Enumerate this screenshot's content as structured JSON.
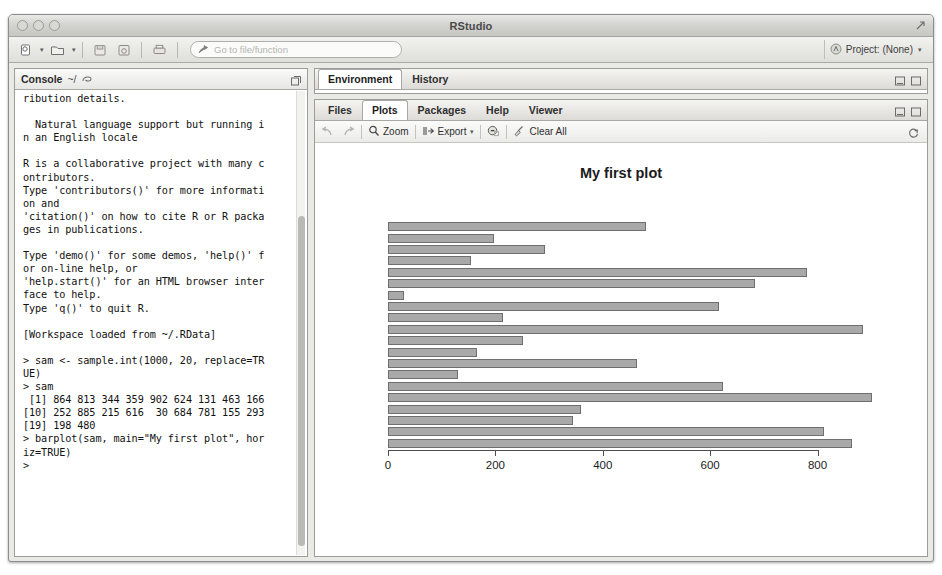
{
  "window": {
    "title": "RStudio",
    "traffic_lights": [
      "close-button",
      "minimize-button",
      "zoom-button"
    ],
    "expand_icon": "expand-icon"
  },
  "toolbar": {
    "new_file_label": "",
    "items": [
      {
        "name": "new-file-button",
        "icon": "new-file-icon",
        "caret": true
      },
      {
        "name": "new-project-button",
        "icon": "new-project-icon",
        "caret": true
      },
      {
        "name": "save-button",
        "icon": "save-icon",
        "caret": false
      },
      {
        "name": "save-all-button",
        "icon": "save-all-icon",
        "caret": false
      },
      {
        "name": "print-button",
        "icon": "print-icon",
        "caret": false
      }
    ],
    "goto": {
      "icon": "goto-arrow-icon",
      "placeholder": "Go to file/function",
      "value": ""
    },
    "project": {
      "icon": "project-icon",
      "label": "Project: (None)",
      "caret": "▾"
    }
  },
  "console": {
    "title": "Console",
    "path": "~/",
    "path_icon": "clear-console-icon",
    "maximize_icon": "maximize-icon",
    "text": "ribution details.\n\n  Natural language support but running i\nn an English locale\n\nR is a collaborative project with many c\nontributors.\nType 'contributors()' for more informati\non and\n'citation()' on how to cite R or R packa\nges in publications.\n\nType 'demo()' for some demos, 'help()' f\nor on-line help, or\n'help.start()' for an HTML browser inter\nface to help.\nType 'q()' to quit R.\n\n[Workspace loaded from ~/.RData]\n\n> sam <- sample.int(1000, 20, replace=TR\nUE)\n> sam\n [1] 864 813 344 359 902 624 131 463 166\n[10] 252 885 215 616  30 684 781 155 293\n[19] 198 480\n> barplot(sam, main=\"My first plot\", hor\niz=TRUE)\n> "
  },
  "environment_pane": {
    "tabs": [
      {
        "label": "Environment",
        "active": true
      },
      {
        "label": "History",
        "active": false
      }
    ],
    "icons": [
      "minimize-icon",
      "maximize-icon"
    ]
  },
  "plots_pane": {
    "tabs": [
      {
        "label": "Files",
        "active": false
      },
      {
        "label": "Plots",
        "active": true
      },
      {
        "label": "Packages",
        "active": false
      },
      {
        "label": "Help",
        "active": false
      },
      {
        "label": "Viewer",
        "active": false
      }
    ],
    "icons": [
      "minimize-icon",
      "maximize-icon"
    ],
    "toolbar": {
      "back_icon": "back-arrow-icon",
      "forward_icon": "forward-arrow-icon",
      "zoom_label": "Zoom",
      "zoom_icon": "zoom-magnifier-icon",
      "export_label": "Export",
      "export_icon": "export-icon",
      "export_caret": "▾",
      "remove_icon": "remove-plot-icon",
      "clear_label": "Clear All",
      "clear_icon": "broom-icon",
      "refresh_icon": "refresh-icon"
    }
  },
  "chart_data": {
    "type": "bar",
    "orientation": "horizontal",
    "title": "My first plot",
    "xlabel": "",
    "ylabel": "",
    "values": [
      864,
      813,
      344,
      359,
      902,
      624,
      131,
      463,
      166,
      252,
      885,
      215,
      616,
      30,
      684,
      781,
      155,
      293,
      198,
      480
    ],
    "categories": [
      "1",
      "2",
      "3",
      "4",
      "5",
      "6",
      "7",
      "8",
      "9",
      "10",
      "11",
      "12",
      "13",
      "14",
      "15",
      "16",
      "17",
      "18",
      "19",
      "20"
    ],
    "xlim": [
      0,
      902
    ],
    "xticks": [
      0,
      200,
      400,
      600,
      800
    ],
    "xtick_labels": [
      "0",
      "200",
      "400",
      "600",
      "800"
    ],
    "grid": false,
    "legend": false,
    "bar_color": "#a9a9a9",
    "bar_border": "#6f6f6f",
    "note": "barplot(sam, main=\"My first plot\", horiz=TRUE) - first element drawn at bottom"
  }
}
